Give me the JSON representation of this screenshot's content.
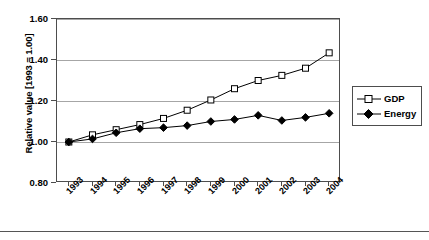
{
  "chart_data": {
    "type": "line",
    "title": "",
    "xlabel": "",
    "ylabel": "Relative value [1993 = 1.00]",
    "categories": [
      "1993",
      "1994",
      "1995",
      "1996",
      "1997",
      "1998",
      "1999",
      "2000",
      "2001",
      "2002",
      "2003",
      "2004"
    ],
    "ylim": [
      0.8,
      1.6
    ],
    "yticks": [
      0.8,
      1.0,
      1.2,
      1.4,
      1.6
    ],
    "ytick_labels": [
      "0.80",
      "1.00",
      "1.20",
      "1.40",
      "1.60"
    ],
    "grid": "horizontal",
    "legend_position": "right",
    "series": [
      {
        "name": "GDP",
        "marker": "open-square",
        "color": "#000000",
        "values": [
          1.0,
          1.035,
          1.06,
          1.085,
          1.115,
          1.155,
          1.205,
          1.26,
          1.3,
          1.325,
          1.36,
          1.435
        ]
      },
      {
        "name": "Energy",
        "marker": "filled-diamond",
        "color": "#000000",
        "values": [
          1.0,
          1.015,
          1.045,
          1.065,
          1.07,
          1.08,
          1.1,
          1.11,
          1.13,
          1.105,
          1.12,
          1.14
        ]
      }
    ]
  },
  "legend": {
    "items": [
      {
        "label": "GDP"
      },
      {
        "label": "Energy"
      }
    ]
  }
}
